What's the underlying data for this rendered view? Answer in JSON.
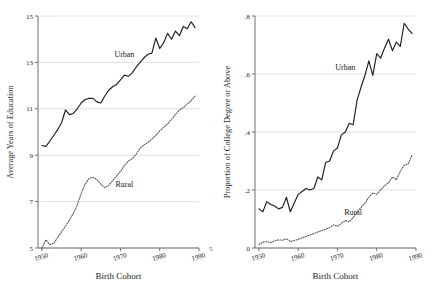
{
  "figure": {
    "name": "Educational attainment by birth cohort, urban vs rural"
  },
  "chart_data": [
    {
      "type": "line",
      "panel": "left",
      "title": "",
      "xlabel": "Birth Cohort",
      "ylabel": "Average Years of Education",
      "xlim": [
        1949,
        1990
      ],
      "ylim": [
        5,
        15
      ],
      "xticks": [
        1950,
        1960,
        1970,
        1980,
        1990
      ],
      "xtick_labels": [
        "1950",
        "1960",
        "1970",
        "1980",
        "1990"
      ],
      "yticks": [
        5,
        7,
        9,
        11,
        13,
        15
      ],
      "ytick_labels": [
        "5",
        "7",
        "9",
        "11",
        "13",
        "15"
      ],
      "grid": "horizontal",
      "legend": "inline-annotation",
      "edge_label_right": "5",
      "series": [
        {
          "name": "Urban",
          "style": "solid",
          "label_x": 1971,
          "label_y": 13.25,
          "x": [
            1950,
            1951,
            1952,
            1953,
            1954,
            1955,
            1956,
            1957,
            1958,
            1959,
            1960,
            1961,
            1962,
            1963,
            1964,
            1965,
            1966,
            1967,
            1968,
            1969,
            1970,
            1971,
            1972,
            1973,
            1974,
            1975,
            1976,
            1977,
            1978,
            1979,
            1980,
            1981,
            1982,
            1983,
            1984,
            1985,
            1986,
            1987,
            1988,
            1989
          ],
          "values": [
            9.42,
            9.38,
            9.6,
            9.85,
            10.1,
            10.4,
            10.95,
            10.75,
            10.8,
            11.0,
            11.25,
            11.4,
            11.45,
            11.45,
            11.3,
            11.25,
            11.55,
            11.8,
            11.95,
            12.05,
            12.25,
            12.45,
            12.4,
            12.55,
            12.8,
            13.0,
            13.2,
            13.35,
            13.4,
            14.05,
            13.6,
            13.85,
            14.25,
            14.0,
            14.35,
            14.15,
            14.55,
            14.45,
            14.75,
            14.5
          ]
        },
        {
          "name": "Rural",
          "style": "dotted",
          "label_x": 1971,
          "label_y": 7.65,
          "x": [
            1950,
            1951,
            1952,
            1953,
            1954,
            1955,
            1956,
            1957,
            1958,
            1959,
            1960,
            1961,
            1962,
            1963,
            1964,
            1965,
            1966,
            1967,
            1968,
            1969,
            1970,
            1971,
            1972,
            1973,
            1974,
            1975,
            1976,
            1977,
            1978,
            1979,
            1980,
            1981,
            1982,
            1983,
            1984,
            1985,
            1986,
            1987,
            1988,
            1989
          ],
          "values": [
            5.0,
            5.35,
            5.15,
            5.2,
            5.45,
            5.7,
            5.95,
            6.2,
            6.5,
            6.85,
            7.35,
            7.75,
            8.0,
            8.05,
            7.95,
            7.75,
            7.6,
            7.7,
            7.9,
            8.1,
            8.3,
            8.55,
            8.75,
            8.85,
            9.05,
            9.3,
            9.45,
            9.55,
            9.7,
            9.85,
            10.05,
            10.2,
            10.35,
            10.55,
            10.75,
            10.95,
            11.05,
            11.2,
            11.35,
            11.55
          ]
        }
      ]
    },
    {
      "type": "line",
      "panel": "right",
      "title": "",
      "xlabel": "Birth Cohort",
      "ylabel": "Proportion of College Degree or Above",
      "xlim": [
        1949,
        1990
      ],
      "ylim": [
        0,
        0.8
      ],
      "xticks": [
        1950,
        1960,
        1970,
        1980,
        1990
      ],
      "xtick_labels": [
        "1950",
        "1960",
        "1970",
        "1980",
        "1990"
      ],
      "yticks": [
        0,
        0.2,
        0.4,
        0.6,
        0.8
      ],
      "ytick_labels": [
        "0",
        ".2",
        ".4",
        ".6",
        ".8"
      ],
      "grid": "horizontal",
      "legend": "inline-annotation",
      "series": [
        {
          "name": "Urban",
          "style": "solid",
          "label_x": 1972,
          "label_y": 0.615,
          "x": [
            1950,
            1951,
            1952,
            1953,
            1954,
            1955,
            1956,
            1957,
            1958,
            1959,
            1960,
            1961,
            1962,
            1963,
            1964,
            1965,
            1966,
            1967,
            1968,
            1969,
            1970,
            1971,
            1972,
            1973,
            1974,
            1975,
            1976,
            1977,
            1978,
            1979,
            1980,
            1981,
            1982,
            1983,
            1984,
            1985,
            1986,
            1987,
            1988,
            1989
          ],
          "values": [
            0.135,
            0.125,
            0.16,
            0.15,
            0.145,
            0.135,
            0.14,
            0.175,
            0.125,
            0.155,
            0.185,
            0.195,
            0.205,
            0.2,
            0.205,
            0.245,
            0.235,
            0.295,
            0.3,
            0.335,
            0.345,
            0.39,
            0.4,
            0.43,
            0.425,
            0.51,
            0.555,
            0.595,
            0.645,
            0.595,
            0.67,
            0.655,
            0.69,
            0.72,
            0.68,
            0.71,
            0.695,
            0.775,
            0.755,
            0.74
          ]
        },
        {
          "name": "Rural",
          "style": "dotted",
          "label_x": 1974,
          "label_y": 0.115,
          "x": [
            1950,
            1951,
            1952,
            1953,
            1954,
            1955,
            1956,
            1957,
            1958,
            1959,
            1960,
            1961,
            1962,
            1963,
            1964,
            1965,
            1966,
            1967,
            1968,
            1969,
            1970,
            1971,
            1972,
            1973,
            1974,
            1975,
            1976,
            1977,
            1978,
            1979,
            1980,
            1981,
            1982,
            1983,
            1984,
            1985,
            1986,
            1987,
            1988,
            1989
          ],
          "values": [
            0.012,
            0.02,
            0.022,
            0.018,
            0.025,
            0.028,
            0.027,
            0.032,
            0.022,
            0.026,
            0.03,
            0.035,
            0.04,
            0.045,
            0.05,
            0.055,
            0.06,
            0.065,
            0.07,
            0.08,
            0.075,
            0.085,
            0.095,
            0.09,
            0.105,
            0.125,
            0.14,
            0.155,
            0.175,
            0.19,
            0.185,
            0.2,
            0.215,
            0.225,
            0.245,
            0.235,
            0.265,
            0.285,
            0.29,
            0.32
          ]
        }
      ]
    }
  ]
}
